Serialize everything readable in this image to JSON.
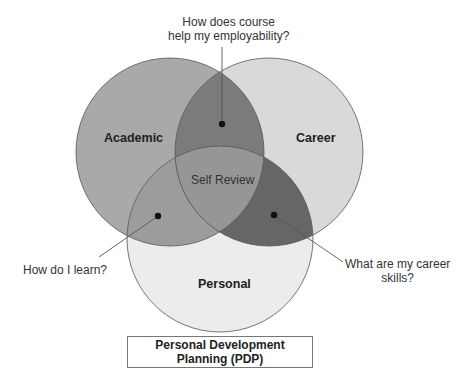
{
  "diagram": {
    "type": "venn",
    "sets": [
      {
        "id": "academic",
        "label": "Academic",
        "color": "#a9a9a9"
      },
      {
        "id": "career",
        "label": "Career",
        "color": "#d9d9d9"
      },
      {
        "id": "personal",
        "label": "Personal",
        "color": "#ececec"
      }
    ],
    "intersections": {
      "academic_career": {
        "color": "#7b7b7b",
        "question": "How does course help my employability?"
      },
      "academic_personal": {
        "color": "#9c9c9c",
        "question": "How do I learn?"
      },
      "career_personal": {
        "color": "#666666",
        "question": "What are my career skills?"
      },
      "all": {
        "color": "#969696",
        "label": "Self Review"
      }
    },
    "questions": {
      "top_line1": "How does course",
      "top_line2": "help my employability?",
      "left": "How do I learn?",
      "right_line1": "What are my career",
      "right_line2": "skills?"
    },
    "footer": {
      "line1": "Personal Development",
      "line2": "Planning (PDP)"
    }
  }
}
